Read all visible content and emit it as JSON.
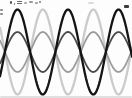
{
  "canvas": {
    "width": 132,
    "height": 98,
    "background": "#fdfdfd"
  },
  "chart_data": {
    "type": "line",
    "title": "",
    "xlabel": "",
    "ylabel": "",
    "description_visible_axes": "none (unlabeled wave illustration)",
    "midline_y": 52,
    "period_px": 50.5,
    "x_range_px": [
      0,
      132
    ],
    "waves": [
      {
        "name": "full-amplitude-antiphase-wave",
        "color": "#cbcbcb",
        "amplitude_px": 42.5,
        "peak_x": 42.8,
        "stroke_width": 2.3
      },
      {
        "name": "half-amplitude-antiphase-wave",
        "color": "#9b9b9b",
        "amplitude_px": 20,
        "peak_x": 42.8,
        "stroke_width": 1.8
      },
      {
        "name": "half-amplitude-inphase-wave",
        "color": "#4a4a4a",
        "amplitude_px": 20,
        "peak_x": 17.5,
        "stroke_width": 1.8
      },
      {
        "name": "full-amplitude-inphase-wave",
        "color": "#141414",
        "amplitude_px": 42.5,
        "peak_x": 17.5,
        "stroke_width": 2.3
      }
    ]
  },
  "artifacts": {
    "note": "illegible clipped text strokes along top and left edges of the crop",
    "marks": [
      {
        "name": "left-margin-fragment",
        "x": 0,
        "y": 9,
        "w": 2.5,
        "h": 1.5,
        "color": "#8a8a8a"
      },
      {
        "name": "left-margin-fragment",
        "x": 0,
        "y": 13,
        "w": 2.5,
        "h": 1.5,
        "color": "#8a8a8a"
      },
      {
        "name": "clipped-text-fragment",
        "x": 10,
        "y": 1,
        "w": 2,
        "h": 3,
        "color": "#555555"
      },
      {
        "name": "clipped-text-fragment",
        "x": 13.5,
        "y": 3,
        "w": 1.5,
        "h": 1.5,
        "color": "#777777"
      },
      {
        "name": "clipped-text-fragment",
        "x": 17,
        "y": 1,
        "w": 4.5,
        "h": 1,
        "color": "#666666"
      },
      {
        "name": "clipped-text-fragment",
        "x": 17,
        "y": 3,
        "w": 4.5,
        "h": 1,
        "color": "#666666"
      },
      {
        "name": "clipped-text-fragment",
        "x": 24,
        "y": 2,
        "w": 3,
        "h": 1.5,
        "color": "#aaaaaa"
      },
      {
        "name": "clipped-text-fragment",
        "x": 29,
        "y": 1,
        "w": 4,
        "h": 2,
        "color": "#999999"
      },
      {
        "name": "clipped-text-fragment",
        "x": 35,
        "y": 2,
        "w": 3,
        "h": 1.5,
        "color": "#9d9d9d"
      },
      {
        "name": "clipped-text-fragment",
        "x": 39,
        "y": 1,
        "w": 2,
        "h": 2,
        "color": "#777777"
      },
      {
        "name": "clipped-text-fragment",
        "x": 88,
        "y": 2,
        "w": 6,
        "h": 2,
        "color": "#dcdcdc"
      },
      {
        "name": "clipped-text-fragment",
        "x": 124,
        "y": 5,
        "w": 5,
        "h": 2.5,
        "color": "#3a3a3a"
      },
      {
        "name": "bottom-edge-shading",
        "x": 0,
        "y": 96,
        "w": 132,
        "h": 2,
        "color": "#e0e0e0"
      }
    ]
  }
}
